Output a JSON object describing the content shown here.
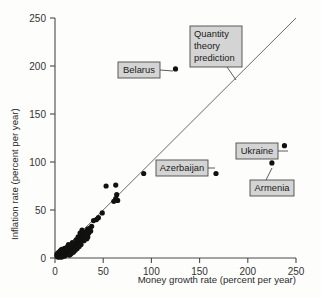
{
  "chart_data": {
    "type": "scatter",
    "title": "",
    "xlabel": "Money growth rate (percent per year)",
    "ylabel": "Inflation rate (percent per year)",
    "xlim": [
      0,
      250
    ],
    "ylim": [
      0,
      250
    ],
    "xticks": [
      0,
      50,
      100,
      150,
      200,
      250
    ],
    "yticks": [
      0,
      50,
      100,
      150,
      200,
      250
    ],
    "xtick_labels": [
      "0",
      "50",
      "100",
      "150",
      "200",
      "250"
    ],
    "ytick_labels": [
      "0",
      "50",
      "100",
      "150",
      "200",
      "250"
    ],
    "grid": false,
    "legend": "none",
    "reference_line": {
      "name": "Quantity theory prediction",
      "slope": 1,
      "intercept": 0,
      "x_range": [
        0,
        250
      ]
    },
    "points": [
      {
        "x": 125,
        "y": 197,
        "label": "Belarus"
      },
      {
        "x": 167,
        "y": 88,
        "label": "Azerbaijan"
      },
      {
        "x": 238,
        "y": 117,
        "label": "Ukraine"
      },
      {
        "x": 225,
        "y": 99,
        "label": "Armenia"
      },
      {
        "x": 92,
        "y": 88,
        "label": ""
      },
      {
        "x": 53,
        "y": 75,
        "label": ""
      },
      {
        "x": 63,
        "y": 76,
        "label": ""
      },
      {
        "x": 64,
        "y": 66,
        "label": ""
      },
      {
        "x": 63,
        "y": 62,
        "label": ""
      },
      {
        "x": 65,
        "y": 60,
        "label": ""
      },
      {
        "x": 61,
        "y": 59,
        "label": ""
      },
      {
        "x": 49,
        "y": 47,
        "label": ""
      },
      {
        "x": 45,
        "y": 42,
        "label": ""
      },
      {
        "x": 43,
        "y": 40,
        "label": ""
      },
      {
        "x": 40,
        "y": 39,
        "label": ""
      },
      {
        "x": 38,
        "y": 33,
        "label": ""
      },
      {
        "x": 36,
        "y": 31,
        "label": ""
      },
      {
        "x": 34,
        "y": 30,
        "label": ""
      },
      {
        "x": 33,
        "y": 28,
        "label": ""
      },
      {
        "x": 32,
        "y": 27,
        "label": ""
      },
      {
        "x": 31,
        "y": 26,
        "label": ""
      },
      {
        "x": 30,
        "y": 25,
        "label": ""
      },
      {
        "x": 30,
        "y": 23,
        "label": ""
      },
      {
        "x": 29,
        "y": 22,
        "label": ""
      },
      {
        "x": 31,
        "y": 21,
        "label": ""
      },
      {
        "x": 33,
        "y": 20,
        "label": ""
      },
      {
        "x": 34,
        "y": 22,
        "label": ""
      },
      {
        "x": 28,
        "y": 19,
        "label": ""
      },
      {
        "x": 27,
        "y": 24,
        "label": ""
      },
      {
        "x": 26,
        "y": 21,
        "label": ""
      },
      {
        "x": 25,
        "y": 18,
        "label": ""
      },
      {
        "x": 24,
        "y": 17,
        "label": ""
      },
      {
        "x": 23,
        "y": 16,
        "label": ""
      },
      {
        "x": 22,
        "y": 15,
        "label": ""
      },
      {
        "x": 21,
        "y": 15,
        "label": ""
      },
      {
        "x": 21,
        "y": 13,
        "label": ""
      },
      {
        "x": 20,
        "y": 14,
        "label": ""
      },
      {
        "x": 20,
        "y": 12,
        "label": ""
      },
      {
        "x": 19,
        "y": 13,
        "label": ""
      },
      {
        "x": 19,
        "y": 11,
        "label": ""
      },
      {
        "x": 18,
        "y": 12,
        "label": ""
      },
      {
        "x": 18,
        "y": 10,
        "label": ""
      },
      {
        "x": 17,
        "y": 11,
        "label": ""
      },
      {
        "x": 17,
        "y": 9,
        "label": ""
      },
      {
        "x": 16,
        "y": 10,
        "label": ""
      },
      {
        "x": 16,
        "y": 8,
        "label": ""
      },
      {
        "x": 15,
        "y": 11,
        "label": ""
      },
      {
        "x": 15,
        "y": 9,
        "label": ""
      },
      {
        "x": 15,
        "y": 7,
        "label": ""
      },
      {
        "x": 14,
        "y": 10,
        "label": ""
      },
      {
        "x": 14,
        "y": 8,
        "label": ""
      },
      {
        "x": 14,
        "y": 6,
        "label": ""
      },
      {
        "x": 13,
        "y": 9,
        "label": ""
      },
      {
        "x": 13,
        "y": 7,
        "label": ""
      },
      {
        "x": 13,
        "y": 5,
        "label": ""
      },
      {
        "x": 12,
        "y": 10,
        "label": ""
      },
      {
        "x": 12,
        "y": 8,
        "label": ""
      },
      {
        "x": 12,
        "y": 6,
        "label": ""
      },
      {
        "x": 12,
        "y": 4,
        "label": ""
      },
      {
        "x": 11,
        "y": 9,
        "label": ""
      },
      {
        "x": 11,
        "y": 7,
        "label": ""
      },
      {
        "x": 11,
        "y": 5,
        "label": ""
      },
      {
        "x": 11,
        "y": 3,
        "label": ""
      },
      {
        "x": 10,
        "y": 10,
        "label": ""
      },
      {
        "x": 10,
        "y": 8,
        "label": ""
      },
      {
        "x": 10,
        "y": 6,
        "label": ""
      },
      {
        "x": 10,
        "y": 4,
        "label": ""
      },
      {
        "x": 10,
        "y": 2,
        "label": ""
      },
      {
        "x": 9,
        "y": 9,
        "label": ""
      },
      {
        "x": 9,
        "y": 7,
        "label": ""
      },
      {
        "x": 9,
        "y": 5,
        "label": ""
      },
      {
        "x": 9,
        "y": 3,
        "label": ""
      },
      {
        "x": 8,
        "y": 8,
        "label": ""
      },
      {
        "x": 8,
        "y": 6,
        "label": ""
      },
      {
        "x": 8,
        "y": 4,
        "label": ""
      },
      {
        "x": 8,
        "y": 2,
        "label": ""
      },
      {
        "x": 7,
        "y": 9,
        "label": ""
      },
      {
        "x": 7,
        "y": 7,
        "label": ""
      },
      {
        "x": 7,
        "y": 5,
        "label": ""
      },
      {
        "x": 7,
        "y": 3,
        "label": ""
      },
      {
        "x": 7,
        "y": 1,
        "label": ""
      },
      {
        "x": 6,
        "y": 8,
        "label": ""
      },
      {
        "x": 6,
        "y": 6,
        "label": ""
      },
      {
        "x": 6,
        "y": 4,
        "label": ""
      },
      {
        "x": 6,
        "y": 2,
        "label": ""
      },
      {
        "x": 5,
        "y": 7,
        "label": ""
      },
      {
        "x": 5,
        "y": 5,
        "label": ""
      },
      {
        "x": 5,
        "y": 3,
        "label": ""
      },
      {
        "x": 5,
        "y": 1,
        "label": ""
      },
      {
        "x": 4,
        "y": 6,
        "label": ""
      },
      {
        "x": 4,
        "y": 4,
        "label": ""
      },
      {
        "x": 4,
        "y": 2,
        "label": ""
      },
      {
        "x": 3,
        "y": 5,
        "label": ""
      },
      {
        "x": 3,
        "y": 3,
        "label": ""
      },
      {
        "x": 3,
        "y": 1,
        "label": ""
      },
      {
        "x": 2,
        "y": 4,
        "label": ""
      },
      {
        "x": 2,
        "y": 2,
        "label": ""
      },
      {
        "x": 17,
        "y": 5,
        "label": ""
      },
      {
        "x": 16,
        "y": 4,
        "label": ""
      },
      {
        "x": 15,
        "y": 3,
        "label": ""
      },
      {
        "x": 19,
        "y": 6,
        "label": ""
      },
      {
        "x": 21,
        "y": 8,
        "label": ""
      },
      {
        "x": 23,
        "y": 10,
        "label": ""
      },
      {
        "x": 25,
        "y": 12,
        "label": ""
      },
      {
        "x": 27,
        "y": 14,
        "label": ""
      },
      {
        "x": 13,
        "y": 12,
        "label": ""
      },
      {
        "x": 14,
        "y": 14,
        "label": ""
      },
      {
        "x": 16,
        "y": 13,
        "label": ""
      },
      {
        "x": 18,
        "y": 16,
        "label": ""
      },
      {
        "x": 22,
        "y": 19,
        "label": ""
      },
      {
        "x": 24,
        "y": 22,
        "label": ""
      },
      {
        "x": 26,
        "y": 26,
        "label": ""
      },
      {
        "x": 28,
        "y": 29,
        "label": ""
      },
      {
        "x": 30,
        "y": 18,
        "label": ""
      },
      {
        "x": 32,
        "y": 23,
        "label": ""
      },
      {
        "x": 35,
        "y": 26,
        "label": ""
      },
      {
        "x": 37,
        "y": 28,
        "label": ""
      }
    ]
  },
  "annotations": {
    "belarus": {
      "label": "Belarus",
      "box": {
        "x": 118,
        "y": 62,
        "w": 42,
        "h": 16
      },
      "leader": {
        "x1": 160,
        "y1": 70,
        "x2": 173,
        "y2": 71
      },
      "point": {
        "x": 125,
        "y": 197
      }
    },
    "quantity_theory": {
      "lines": [
        "Quantity",
        "theory",
        "prediction"
      ],
      "box": {
        "x": 190,
        "y": 26,
        "w": 52,
        "h": 41
      },
      "leader": {
        "x1": 227,
        "y1": 67,
        "x2": 236,
        "y2": 80
      }
    },
    "azerbaijan": {
      "label": "Azerbaijan",
      "box": {
        "x": 156,
        "y": 160,
        "w": 52,
        "h": 16
      },
      "leader": {
        "x1": 208,
        "y1": 168,
        "x2": 215,
        "y2": 168
      },
      "point": {
        "x": 167,
        "y": 88
      }
    },
    "ukraine": {
      "label": "Ukraine",
      "box": {
        "x": 236,
        "y": 143,
        "w": 42,
        "h": 16
      },
      "leader": {
        "x1": 278,
        "y1": 151,
        "x2": 288,
        "y2": 151
      },
      "point": {
        "x": 238,
        "y": 117
      }
    },
    "armenia": {
      "label": "Armenia",
      "box": {
        "x": 250,
        "y": 180,
        "w": 44,
        "h": 16
      },
      "leader": {
        "x1": 266,
        "y1": 180,
        "x2": 272,
        "y2": 168
      },
      "point": {
        "x": 225,
        "y": 99
      }
    }
  },
  "colors": {
    "point": "#111111",
    "axis": "#4a4a4a",
    "prediction_line": "#6b6b6b",
    "callout_fill": "#d4d4d4",
    "background": "#fdfdfb"
  }
}
